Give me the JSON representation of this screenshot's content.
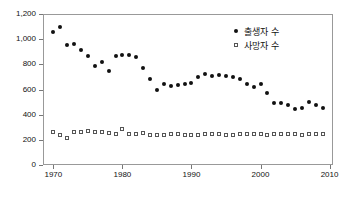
{
  "chart_data": {
    "type": "scatter",
    "title": "",
    "subtitle": "",
    "xlabel": "",
    "ylabel": "",
    "xlim": [
      1968.5,
      2010.5
    ],
    "ylim": [
      0,
      1200
    ],
    "grid": false,
    "legend_position": "top-right",
    "x_tick_labels": [
      "1970",
      "1980",
      "1990",
      "2000",
      "2010"
    ],
    "x_ticks": [
      1970,
      1980,
      1990,
      2000,
      2010
    ],
    "y_tick_labels": [
      "0",
      "200",
      "400",
      "600",
      "800",
      "1,000",
      "1,200"
    ],
    "y_ticks": [
      0,
      200,
      400,
      600,
      800,
      1000,
      1200
    ],
    "x": [
      1970,
      1971,
      1972,
      1973,
      1974,
      1975,
      1976,
      1977,
      1978,
      1979,
      1980,
      1981,
      1982,
      1983,
      1984,
      1985,
      1986,
      1987,
      1988,
      1989,
      1990,
      1991,
      1992,
      1993,
      1994,
      1995,
      1996,
      1997,
      1998,
      1999,
      2000,
      2001,
      2002,
      2003,
      2004,
      2005,
      2006,
      2007,
      2008,
      2009
    ],
    "series": [
      {
        "name": "출생자 수",
        "marker": "filled-circle",
        "color": "#111111",
        "values": [
          1055,
          1100,
          950,
          960,
          915,
          865,
          790,
          820,
          750,
          870,
          875,
          875,
          860,
          770,
          685,
          600,
          640,
          625,
          635,
          645,
          655,
          700,
          725,
          710,
          715,
          705,
          700,
          680,
          640,
          620,
          640,
          570,
          495,
          495,
          475,
          445,
          450,
          500,
          480,
          450
        ]
      },
      {
        "name": "사망자 수",
        "marker": "open-square",
        "color": "#555555",
        "values": [
          265,
          240,
          215,
          260,
          265,
          270,
          265,
          260,
          255,
          245,
          290,
          245,
          248,
          255,
          242,
          242,
          242,
          243,
          243,
          242,
          242,
          242,
          245,
          243,
          243,
          242,
          242,
          243,
          243,
          245,
          246,
          242,
          247,
          245,
          244,
          245,
          242,
          245,
          246,
          247
        ]
      }
    ],
    "legend": [
      {
        "label": "출생자 수",
        "marker": "filled-circle"
      },
      {
        "label": "사망자 수",
        "marker": "open-square"
      }
    ]
  }
}
